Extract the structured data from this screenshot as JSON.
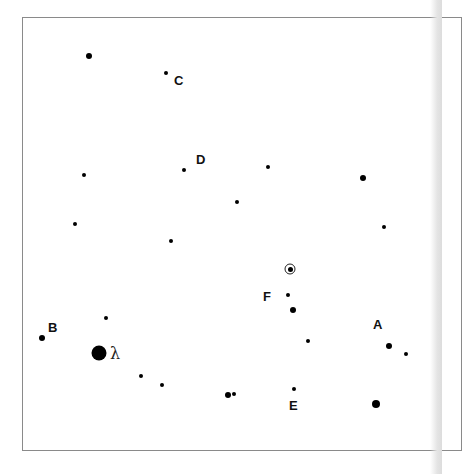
{
  "diagram": {
    "type": "star-field",
    "labels": {
      "A": "A",
      "B": "B",
      "C": "C",
      "D": "D",
      "E": "E",
      "F": "F",
      "lambda": "λ"
    },
    "stars": [
      {
        "x": 89,
        "y": 56,
        "size": "s3"
      },
      {
        "x": 166,
        "y": 73,
        "size": "s2"
      },
      {
        "x": 184,
        "y": 170,
        "size": "s2"
      },
      {
        "x": 84,
        "y": 175,
        "size": "s2"
      },
      {
        "x": 75,
        "y": 224,
        "size": "s2"
      },
      {
        "x": 268,
        "y": 167,
        "size": "s2"
      },
      {
        "x": 237,
        "y": 202,
        "size": "s2"
      },
      {
        "x": 363,
        "y": 178,
        "size": "s3"
      },
      {
        "x": 384,
        "y": 227,
        "size": "s2"
      },
      {
        "x": 171,
        "y": 241,
        "size": "s2"
      },
      {
        "x": 288,
        "y": 295,
        "size": "s2"
      },
      {
        "x": 293,
        "y": 310,
        "size": "s3"
      },
      {
        "x": 106,
        "y": 318,
        "size": "s2"
      },
      {
        "x": 42,
        "y": 338,
        "size": "s3"
      },
      {
        "x": 99,
        "y": 353,
        "size": "s6"
      },
      {
        "x": 308,
        "y": 341,
        "size": "s2"
      },
      {
        "x": 389,
        "y": 346,
        "size": "s3"
      },
      {
        "x": 406,
        "y": 354,
        "size": "s2"
      },
      {
        "x": 141,
        "y": 376,
        "size": "s2"
      },
      {
        "x": 162,
        "y": 385,
        "size": "s2"
      },
      {
        "x": 228,
        "y": 395,
        "size": "s3"
      },
      {
        "x": 234,
        "y": 394,
        "size": "s2"
      },
      {
        "x": 294,
        "y": 389,
        "size": "s2"
      },
      {
        "x": 376,
        "y": 404,
        "size": "s4"
      }
    ],
    "sun": {
      "x": 290,
      "y": 269
    }
  }
}
